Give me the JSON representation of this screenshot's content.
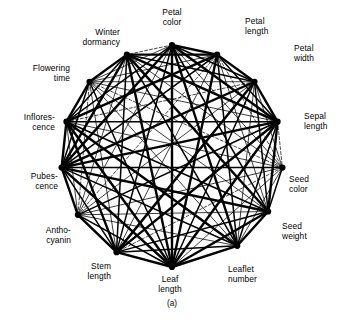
{
  "figure": {
    "caption": "(a)",
    "title": "",
    "background_color": "#ffffff",
    "ink_color": "#000000"
  },
  "chart_data": {
    "type": "diagram",
    "subtype": "circular-correlation-network",
    "title": "",
    "subtitle": "",
    "xlabel": "",
    "ylabel": "",
    "caption": "(a)",
    "legend": [],
    "grid": false,
    "layout": {
      "shape": "circle",
      "center_x": 172,
      "center_y": 156,
      "radius": 111,
      "node_count": 15,
      "start_angle_deg": -90,
      "direction": "clockwise"
    },
    "categories": [
      "Petal color",
      "Petal length",
      "Petal width",
      "Sepal length",
      "Seed color",
      "Seed weight",
      "Leaflet number",
      "Leaf length",
      "Stem length",
      "Anthocyanin",
      "Pubescence",
      "Inflorescence",
      "Flowering time",
      "Winter dormancy"
    ],
    "nodes": [
      {
        "id": 0,
        "label": "Petal\ncolor",
        "label_lines": [
          "Petal",
          "color"
        ],
        "angle_deg": -90,
        "label_x": 172,
        "label_y": 8,
        "label_align": "center"
      },
      {
        "id": 1,
        "label": "Petal\nlength",
        "label_lines": [
          "Petal",
          "length"
        ],
        "angle_deg": -66,
        "label_x": 245,
        "label_y": 17,
        "label_align": "left"
      },
      {
        "id": 2,
        "label": "Petal\nwidth",
        "label_lines": [
          "Petal",
          "width"
        ],
        "angle_deg": -42,
        "label_x": 294,
        "label_y": 44,
        "label_align": "left"
      },
      {
        "id": 3,
        "label": "Sepal\nlength",
        "label_lines": [
          "Sepal",
          "length"
        ],
        "angle_deg": -18,
        "label_x": 304,
        "label_y": 112,
        "label_align": "left"
      },
      {
        "id": 4,
        "label": "Seed\ncolor",
        "label_lines": [
          "Seed",
          "color"
        ],
        "angle_deg": 6,
        "label_x": 289,
        "label_y": 175,
        "label_align": "left"
      },
      {
        "id": 5,
        "label": "Seed\nweight",
        "label_lines": [
          "Seed",
          "weight"
        ],
        "angle_deg": 30,
        "label_x": 282,
        "label_y": 222,
        "label_align": "left"
      },
      {
        "id": 6,
        "label": "Leaflet\nnumber",
        "label_lines": [
          "Leaflet",
          "number"
        ],
        "angle_deg": 54,
        "label_x": 228,
        "label_y": 265,
        "label_align": "left"
      },
      {
        "id": 7,
        "label": "Leaf\nlength",
        "label_lines": [
          "Leaf",
          "length"
        ],
        "angle_deg": 90,
        "label_x": 170,
        "label_y": 275,
        "label_align": "center"
      },
      {
        "id": 8,
        "label": "Stem\nlength",
        "label_lines": [
          "Stem",
          "length"
        ],
        "angle_deg": 120,
        "label_x": 111,
        "label_y": 262,
        "label_align": "right"
      },
      {
        "id": 9,
        "label": "Antho-\ncyanin",
        "label_lines": [
          "Antho-",
          "cyanin"
        ],
        "angle_deg": 148,
        "label_x": 71,
        "label_y": 226,
        "label_align": "right"
      },
      {
        "id": 10,
        "label": "Pubes-\ncence",
        "label_lines": [
          "Pubes-",
          "cence"
        ],
        "angle_deg": 174,
        "label_x": 58,
        "label_y": 172,
        "label_align": "right"
      },
      {
        "id": 11,
        "label": "Inflores-\ncence",
        "label_lines": [
          "Inflores-",
          "cence"
        ],
        "angle_deg": -162,
        "label_x": 55,
        "label_y": 113,
        "label_align": "right"
      },
      {
        "id": 12,
        "label": "Flowering\ntime",
        "label_lines": [
          "Flowering",
          "time"
        ],
        "angle_deg": -138,
        "label_x": 70,
        "label_y": 64,
        "label_align": "right"
      },
      {
        "id": 13,
        "label": "Winter\ndormancy",
        "label_lines": [
          "Winter",
          "dormancy"
        ],
        "angle_deg": -114,
        "label_x": 120,
        "label_y": 28,
        "label_align": "right"
      }
    ],
    "edge_styles": [
      {
        "name": "strong",
        "stroke_width": 2.4,
        "dash": "none",
        "description": "thick solid line, strongest linkage"
      },
      {
        "name": "medium",
        "stroke_width": 1.5,
        "dash": "none",
        "description": "medium solid line"
      },
      {
        "name": "light",
        "stroke_width": 0.75,
        "dash": "none",
        "description": "thin solid line"
      },
      {
        "name": "faint",
        "stroke_width": 0.5,
        "dash": "none",
        "description": "very thin solid line"
      },
      {
        "name": "dashed",
        "stroke_width": 0.7,
        "dash": "3,2",
        "description": "dashed line, weak or inverse linkage"
      }
    ],
    "edges": [
      {
        "a": 0,
        "b": 1,
        "style": "strong"
      },
      {
        "a": 0,
        "b": 2,
        "style": "medium"
      },
      {
        "a": 0,
        "b": 3,
        "style": "strong"
      },
      {
        "a": 0,
        "b": 4,
        "style": "light"
      },
      {
        "a": 0,
        "b": 5,
        "style": "medium"
      },
      {
        "a": 0,
        "b": 6,
        "style": "strong"
      },
      {
        "a": 0,
        "b": 7,
        "style": "strong"
      },
      {
        "a": 0,
        "b": 8,
        "style": "medium"
      },
      {
        "a": 0,
        "b": 9,
        "style": "light"
      },
      {
        "a": 0,
        "b": 10,
        "style": "strong"
      },
      {
        "a": 0,
        "b": 11,
        "style": "medium"
      },
      {
        "a": 0,
        "b": 12,
        "style": "light"
      },
      {
        "a": 0,
        "b": 13,
        "style": "dashed"
      },
      {
        "a": 1,
        "b": 2,
        "style": "strong"
      },
      {
        "a": 1,
        "b": 3,
        "style": "medium"
      },
      {
        "a": 1,
        "b": 4,
        "style": "dashed"
      },
      {
        "a": 1,
        "b": 5,
        "style": "light"
      },
      {
        "a": 1,
        "b": 6,
        "style": "medium"
      },
      {
        "a": 1,
        "b": 7,
        "style": "strong"
      },
      {
        "a": 1,
        "b": 8,
        "style": "light"
      },
      {
        "a": 1,
        "b": 9,
        "style": "dashed"
      },
      {
        "a": 1,
        "b": 10,
        "style": "medium"
      },
      {
        "a": 1,
        "b": 11,
        "style": "strong"
      },
      {
        "a": 1,
        "b": 12,
        "style": "light"
      },
      {
        "a": 1,
        "b": 13,
        "style": "strong"
      },
      {
        "a": 2,
        "b": 3,
        "style": "strong"
      },
      {
        "a": 2,
        "b": 4,
        "style": "light"
      },
      {
        "a": 2,
        "b": 5,
        "style": "medium"
      },
      {
        "a": 2,
        "b": 6,
        "style": "light"
      },
      {
        "a": 2,
        "b": 7,
        "style": "medium"
      },
      {
        "a": 2,
        "b": 8,
        "style": "strong"
      },
      {
        "a": 2,
        "b": 9,
        "style": "light"
      },
      {
        "a": 2,
        "b": 10,
        "style": "strong"
      },
      {
        "a": 2,
        "b": 11,
        "style": "dashed"
      },
      {
        "a": 2,
        "b": 12,
        "style": "light"
      },
      {
        "a": 2,
        "b": 13,
        "style": "medium"
      },
      {
        "a": 3,
        "b": 4,
        "style": "dashed"
      },
      {
        "a": 3,
        "b": 5,
        "style": "strong"
      },
      {
        "a": 3,
        "b": 6,
        "style": "medium"
      },
      {
        "a": 3,
        "b": 7,
        "style": "strong"
      },
      {
        "a": 3,
        "b": 8,
        "style": "strong"
      },
      {
        "a": 3,
        "b": 9,
        "style": "medium"
      },
      {
        "a": 3,
        "b": 10,
        "style": "strong"
      },
      {
        "a": 3,
        "b": 11,
        "style": "medium"
      },
      {
        "a": 3,
        "b": 12,
        "style": "light"
      },
      {
        "a": 3,
        "b": 13,
        "style": "strong"
      },
      {
        "a": 4,
        "b": 5,
        "style": "medium"
      },
      {
        "a": 4,
        "b": 6,
        "style": "light"
      },
      {
        "a": 4,
        "b": 7,
        "style": "light"
      },
      {
        "a": 4,
        "b": 8,
        "style": "dashed"
      },
      {
        "a": 4,
        "b": 9,
        "style": "light"
      },
      {
        "a": 4,
        "b": 10,
        "style": "medium"
      },
      {
        "a": 4,
        "b": 11,
        "style": "light"
      },
      {
        "a": 4,
        "b": 12,
        "style": "dashed"
      },
      {
        "a": 4,
        "b": 13,
        "style": "light"
      },
      {
        "a": 5,
        "b": 6,
        "style": "strong"
      },
      {
        "a": 5,
        "b": 7,
        "style": "strong"
      },
      {
        "a": 5,
        "b": 8,
        "style": "medium"
      },
      {
        "a": 5,
        "b": 9,
        "style": "light"
      },
      {
        "a": 5,
        "b": 10,
        "style": "strong"
      },
      {
        "a": 5,
        "b": 11,
        "style": "medium"
      },
      {
        "a": 5,
        "b": 12,
        "style": "light"
      },
      {
        "a": 5,
        "b": 13,
        "style": "strong"
      },
      {
        "a": 6,
        "b": 7,
        "style": "strong"
      },
      {
        "a": 6,
        "b": 8,
        "style": "medium"
      },
      {
        "a": 6,
        "b": 9,
        "style": "light"
      },
      {
        "a": 6,
        "b": 10,
        "style": "medium"
      },
      {
        "a": 6,
        "b": 11,
        "style": "strong"
      },
      {
        "a": 6,
        "b": 12,
        "style": "light"
      },
      {
        "a": 6,
        "b": 13,
        "style": "medium"
      },
      {
        "a": 7,
        "b": 8,
        "style": "strong"
      },
      {
        "a": 7,
        "b": 9,
        "style": "medium"
      },
      {
        "a": 7,
        "b": 10,
        "style": "strong"
      },
      {
        "a": 7,
        "b": 11,
        "style": "strong"
      },
      {
        "a": 7,
        "b": 12,
        "style": "medium"
      },
      {
        "a": 7,
        "b": 13,
        "style": "strong"
      },
      {
        "a": 8,
        "b": 9,
        "style": "strong"
      },
      {
        "a": 8,
        "b": 10,
        "style": "medium"
      },
      {
        "a": 8,
        "b": 11,
        "style": "strong"
      },
      {
        "a": 8,
        "b": 12,
        "style": "light"
      },
      {
        "a": 8,
        "b": 13,
        "style": "medium"
      },
      {
        "a": 9,
        "b": 10,
        "style": "strong"
      },
      {
        "a": 9,
        "b": 11,
        "style": "light"
      },
      {
        "a": 9,
        "b": 12,
        "style": "dashed"
      },
      {
        "a": 9,
        "b": 13,
        "style": "light"
      },
      {
        "a": 10,
        "b": 11,
        "style": "strong"
      },
      {
        "a": 10,
        "b": 12,
        "style": "medium"
      },
      {
        "a": 10,
        "b": 13,
        "style": "strong"
      },
      {
        "a": 11,
        "b": 12,
        "style": "strong"
      },
      {
        "a": 11,
        "b": 13,
        "style": "medium"
      },
      {
        "a": 12,
        "b": 13,
        "style": "strong"
      }
    ]
  }
}
